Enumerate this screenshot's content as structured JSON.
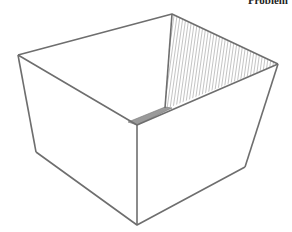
{
  "figure": {
    "corner_label": "Problem",
    "colors": {
      "stroke": "#6e6e6e",
      "hatch": "#8a8a8a",
      "background": "#ffffff"
    }
  }
}
